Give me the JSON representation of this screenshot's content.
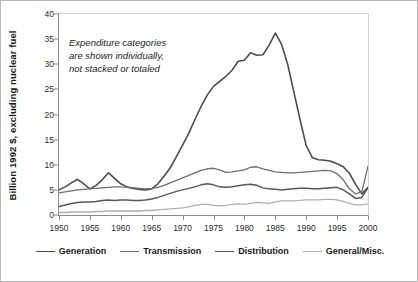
{
  "chart_data": {
    "type": "line",
    "title": "",
    "xlabel": "",
    "ylabel": "Billion 1992 $, excluding nuclear fuel",
    "xlim": [
      1950,
      2000
    ],
    "ylim": [
      0,
      40
    ],
    "yticks": [
      0,
      5,
      10,
      15,
      20,
      25,
      30,
      35,
      40
    ],
    "xticks": [
      1950,
      1955,
      1960,
      1965,
      1970,
      1975,
      1980,
      1985,
      1990,
      1995,
      2000
    ],
    "grid": false,
    "legend_position": "bottom",
    "annotation": {
      "line1": "Expenditure categories",
      "line2": "are shown individually,",
      "line3": "not stacked or totaled"
    },
    "x": [
      1950,
      1951,
      1952,
      1953,
      1954,
      1955,
      1956,
      1957,
      1958,
      1959,
      1960,
      1961,
      1962,
      1963,
      1964,
      1965,
      1966,
      1967,
      1968,
      1969,
      1970,
      1971,
      1972,
      1973,
      1974,
      1975,
      1976,
      1977,
      1978,
      1979,
      1980,
      1981,
      1982,
      1983,
      1984,
      1985,
      1986,
      1987,
      1988,
      1989,
      1990,
      1991,
      1992,
      1993,
      1994,
      1995,
      1996,
      1997,
      1998,
      1999,
      2000
    ],
    "series": [
      {
        "name": "Generation",
        "color": "#4d4d4d",
        "width": 1.6,
        "values": [
          5.0,
          5.6,
          6.4,
          7.1,
          6.2,
          5.2,
          5.9,
          7.0,
          8.4,
          7.3,
          6.2,
          5.6,
          5.3,
          5.1,
          5.0,
          5.2,
          6.2,
          7.7,
          9.4,
          11.6,
          13.9,
          16.3,
          19.0,
          21.6,
          23.9,
          25.6,
          26.6,
          27.6,
          28.8,
          30.6,
          30.8,
          32.3,
          31.8,
          31.9,
          33.8,
          36.2,
          34.0,
          30.0,
          24.5,
          19.0,
          13.8,
          11.4,
          11.0,
          10.9,
          10.7,
          10.2,
          9.6,
          8.3,
          6.1,
          4.2,
          5.5
        ]
      },
      {
        "name": "Transmission",
        "color": "#6e6e6e",
        "width": 1.3,
        "values": [
          4.4,
          4.6,
          4.8,
          5.0,
          5.1,
          5.2,
          5.3,
          5.4,
          5.5,
          5.6,
          5.6,
          5.5,
          5.4,
          5.3,
          5.2,
          5.3,
          5.5,
          5.9,
          6.4,
          6.9,
          7.4,
          7.9,
          8.4,
          8.9,
          9.2,
          9.3,
          9.0,
          8.5,
          8.6,
          8.8,
          9.0,
          9.5,
          9.6,
          9.2,
          8.9,
          8.6,
          8.5,
          8.4,
          8.4,
          8.5,
          8.6,
          8.7,
          8.8,
          8.9,
          8.8,
          8.2,
          7.0,
          5.2,
          4.2,
          4.6,
          9.7
        ]
      },
      {
        "name": "Distribution",
        "color": "#585858",
        "width": 1.5,
        "values": [
          1.7,
          2.0,
          2.3,
          2.5,
          2.6,
          2.6,
          2.7,
          2.9,
          3.0,
          2.9,
          3.0,
          3.0,
          2.9,
          2.9,
          3.0,
          3.2,
          3.5,
          3.9,
          4.3,
          4.7,
          5.0,
          5.3,
          5.6,
          6.0,
          6.2,
          6.0,
          5.6,
          5.5,
          5.6,
          5.8,
          6.0,
          6.1,
          5.9,
          5.4,
          5.2,
          5.1,
          5.0,
          5.1,
          5.2,
          5.3,
          5.3,
          5.2,
          5.2,
          5.3,
          5.4,
          5.5,
          5.0,
          4.2,
          3.3,
          3.5,
          5.4
        ]
      },
      {
        "name": "General/Misc.",
        "color": "#aeaeae",
        "width": 1.3,
        "values": [
          0.5,
          0.5,
          0.6,
          0.6,
          0.6,
          0.6,
          0.7,
          0.7,
          0.8,
          0.8,
          0.8,
          0.8,
          0.8,
          0.8,
          0.9,
          0.9,
          1.0,
          1.1,
          1.2,
          1.3,
          1.4,
          1.6,
          1.9,
          2.1,
          2.1,
          1.9,
          1.8,
          1.9,
          2.1,
          2.2,
          2.1,
          2.3,
          2.5,
          2.4,
          2.3,
          2.6,
          2.8,
          2.8,
          2.8,
          2.9,
          3.0,
          3.0,
          3.0,
          3.1,
          3.1,
          3.0,
          2.7,
          2.3,
          2.0,
          2.0,
          2.2
        ]
      }
    ]
  }
}
